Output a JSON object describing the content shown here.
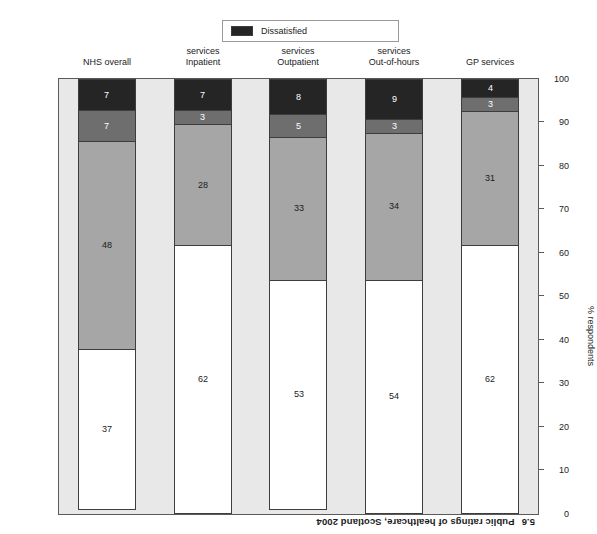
{
  "caption": {
    "number": "5.6",
    "text": "Public ratings of healthcare, Scotland 2004"
  },
  "legend": {
    "items": [
      {
        "label": "Dissatisfied",
        "color": "#252525"
      }
    ]
  },
  "colors": {
    "very_satisfied": "#ffffff",
    "fairly_satisfied": "#a6a6a6",
    "neither": "#6e6e6e",
    "dissatisfied": "#252525",
    "plot_background": "#e8e8e8",
    "axis": "#5a5a5a"
  },
  "chart_data": {
    "type": "bar",
    "title": "Public ratings of healthcare, Scotland 2004",
    "xlabel": "",
    "ylabel": "% respondents",
    "ylim": [
      0,
      100
    ],
    "yticks": [
      0,
      10,
      20,
      30,
      40,
      50,
      60,
      70,
      80,
      90,
      100
    ],
    "grid": false,
    "stacked": true,
    "legend_position": "bottom",
    "categories": [
      "GP services",
      "Out-of-hours services",
      "Outpatient services",
      "Inpatient services",
      "NHS overall"
    ],
    "series": [
      {
        "name": "Very satisfied",
        "color": "#ffffff",
        "values": [
          62,
          54,
          53,
          62,
          37
        ]
      },
      {
        "name": "Fairly satisfied",
        "color": "#a6a6a6",
        "values": [
          31,
          34,
          33,
          28,
          48
        ]
      },
      {
        "name": "Neither",
        "color": "#6e6e6e",
        "values": [
          3,
          3,
          5,
          3,
          7
        ]
      },
      {
        "name": "Dissatisfied",
        "color": "#252525",
        "values": [
          4,
          9,
          8,
          7,
          7
        ]
      }
    ]
  }
}
